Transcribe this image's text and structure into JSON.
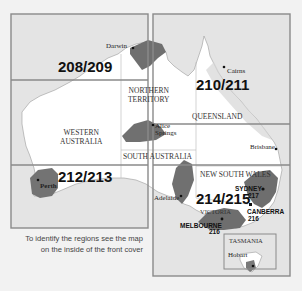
{
  "map": {
    "title": "Australia regional page index map",
    "colors": {
      "background": "#f2f2f2",
      "grid_fill": "#e6e6e6",
      "grid_line": "#8a8a8a",
      "land": "#ffffff",
      "highlight": "#6f6f6f",
      "state_border": "#bdbdbd"
    },
    "page_regions": [
      {
        "id": "208/209",
        "label": "208/209"
      },
      {
        "id": "210/211",
        "label": "210/211"
      },
      {
        "id": "212/213",
        "label": "212/213"
      },
      {
        "id": "214/215",
        "label": "214/215"
      }
    ],
    "states": {
      "northern_territory": "NORTHERN\nTERRITORY",
      "nt_line1": "NORTHERN",
      "nt_line2": "TERRITORY",
      "queensland": "QUEENSLAND",
      "wa_line1": "WESTERN",
      "wa_line2": "AUSTRALIA",
      "south_australia": "SOUTH AUSTRALIA",
      "new_south_wales": "NEW SOUTH WALES",
      "victoria": "VICTORIA",
      "tasmania": "TASMANIA"
    },
    "cities": {
      "darwin": "Darwin",
      "cairns": "Cairns",
      "alice_line1": "Alice",
      "alice_line2": "Springs",
      "brisbane": "Brisbane",
      "perth": "Perth",
      "adelaide": "Adelaide",
      "sydney": "SYDNEY",
      "sydney_page": "217",
      "canberra": "CANBERRA",
      "canberra_page": "216",
      "melbourne": "MELBOURNE",
      "melbourne_page": "216",
      "hobart": "Hobart"
    },
    "caption_line1": "To identify the regions see the map",
    "caption_line2": "on the inside of the front cover"
  }
}
